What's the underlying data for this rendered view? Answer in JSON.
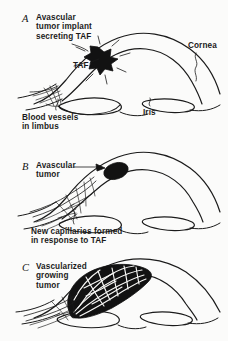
{
  "figure": {
    "background_color": "#fbfbfa",
    "ink_color": "#1b1b1b"
  },
  "panels": [
    {
      "letter": "A",
      "caption": "Avascular\ntumor implant\nsecreting TAF",
      "labels": {
        "taf": "TAF",
        "cornea": "Cornea",
        "blood_vessels": "Blood vessels\nin limbus",
        "iris": "Iris"
      }
    },
    {
      "letter": "B",
      "caption": "Avascular\ntumor",
      "labels": {
        "new_capillaries": "New capillaries formed\nin response to TAF"
      }
    },
    {
      "letter": "C",
      "caption": "Vascularized\ngrowing\ntumor",
      "labels": {}
    }
  ],
  "diagram_data": {
    "type": "line-drawing",
    "subject": "anterior eye (cornea, limbus, iris) in sagittal section",
    "sequence": "three stages of tumor-induced angiogenesis",
    "elements": [
      {
        "panel": "A",
        "structures": [
          "cornea dome (double outline)",
          "limbus",
          "iris (two lobes)",
          "black star-shaped tumor implant with radiating spikes"
        ],
        "vascularity": "sparse pre-existing limbal vessels; tumor avascular",
        "annotation": "tumor secretes TAF (tumor angiogenesis factor) shown as radiating spikes"
      },
      {
        "panel": "B",
        "structures": [
          "cornea dome (double outline)",
          "limbus",
          "iris (two lobes)",
          "solid black oval tumor"
        ],
        "vascularity": "new capillary sprouts extend from limbus toward the tumor",
        "annotation": "capillaries formed in response to TAF"
      },
      {
        "panel": "C",
        "structures": [
          "cornea dome (double outline)",
          "limbus",
          "iris (two lobes)",
          "large black lens-shaped tumor mass"
        ],
        "vascularity": "dense vessel bundle penetrates and fills the enlarged tumor",
        "annotation": "tumor is now vascularized and growing"
      }
    ]
  }
}
